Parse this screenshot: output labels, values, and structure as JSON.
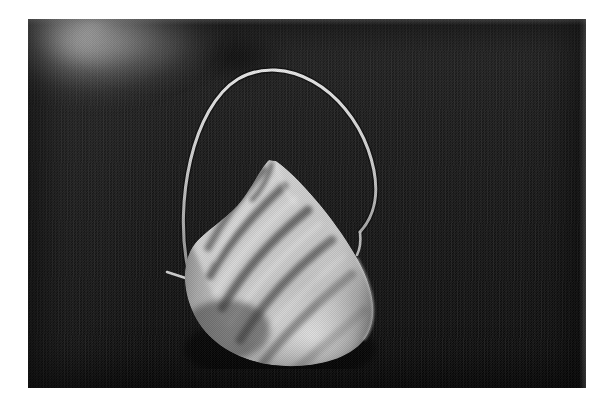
{
  "page": {
    "background_color": "#ffffff",
    "width": 609,
    "height": 408
  },
  "photograph": {
    "subject": "dust-respirator-mask",
    "caption_text": "",
    "rendering": "grayscale halftone print",
    "plate": {
      "left": 28,
      "top": 19,
      "width": 558,
      "height": 369,
      "background_color": "#121212",
      "backdrop_description": "dark textured fabric or board"
    },
    "highlight_region": {
      "name": "upper-left-haze",
      "color": "#f0f0f0",
      "description": "bright blown-out glow fading into the dark backdrop at the top-left corner"
    },
    "mask": {
      "name": "cone-dust-mask",
      "body_color": "#c8c8c8",
      "shadow_color": "#4a4a4a",
      "highlight_color": "#e2e2e2",
      "shape": "teardrop cone with rounded base and pointed apex at upper left",
      "pleat_count": 6,
      "apex": {
        "x": 248,
        "y": 142
      },
      "base_center": {
        "x": 283,
        "y": 300
      }
    },
    "strap": {
      "name": "elastic-head-strap",
      "color": "#d6d6d6",
      "description": "single elastic band arching from the left side of the mask up and over, attaching at the right rim",
      "apex": {
        "x": 218,
        "y": 74
      },
      "left_attachment": {
        "x": 192,
        "y": 264
      },
      "right_attachment": {
        "x": 358,
        "y": 226
      }
    }
  }
}
